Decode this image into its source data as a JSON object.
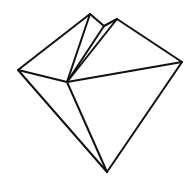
{
  "figure": {
    "canvas": {
      "width": 192,
      "height": 185,
      "background_color": "#ffffff"
    },
    "style": {
      "stroke_color": "#111111",
      "stroke_width": 2,
      "fill": "none",
      "line_cap": "round",
      "line_join": "round"
    },
    "vertices": [
      {
        "id": "left",
        "label": "Left vertex",
        "x": 18,
        "y": 70
      },
      {
        "id": "hub",
        "label": "Central hub vertex",
        "x": 67,
        "y": 82
      },
      {
        "id": "peakA",
        "label": "Left peak",
        "x": 90,
        "y": 14
      },
      {
        "id": "notch",
        "label": "Notch vertex",
        "x": 104,
        "y": 26
      },
      {
        "id": "peakB",
        "label": "Right peak",
        "x": 117,
        "y": 19
      },
      {
        "id": "right",
        "label": "Right vertex",
        "x": 182,
        "y": 62
      },
      {
        "id": "bottom",
        "label": "Bottom apex vertex",
        "x": 107,
        "y": 172
      }
    ],
    "edges": [
      {
        "id": "e1",
        "from": "left",
        "to": "peakA",
        "path": "M 18 70 L 90 14"
      },
      {
        "id": "e2",
        "from": "peakA",
        "to": "hub",
        "path": "M 90 14 L 67 82"
      },
      {
        "id": "e3",
        "from": "peakA",
        "to": "notch",
        "path": "M 90 14 L 104 26"
      },
      {
        "id": "e4",
        "from": "notch",
        "to": "hub",
        "path": "M 104 26 L 67 82"
      },
      {
        "id": "e5",
        "from": "notch",
        "to": "peakB",
        "path": "M 104 26 L 117 19"
      },
      {
        "id": "e6",
        "from": "peakB",
        "to": "hub",
        "path": "M 117 19 L 67 82"
      },
      {
        "id": "e7",
        "from": "peakB",
        "to": "right",
        "path": "M 117 19 L 182 62"
      },
      {
        "id": "e8",
        "from": "left",
        "to": "hub",
        "path": "M 18 70 L 67 82"
      },
      {
        "id": "e9",
        "from": "hub",
        "to": "right",
        "path": "M 67 82 L 182 62"
      },
      {
        "id": "e10",
        "from": "left",
        "to": "bottom",
        "path": "M 18 70 L 107 172"
      },
      {
        "id": "e11",
        "from": "hub",
        "to": "bottom",
        "path": "M 67 82 L 107 172"
      },
      {
        "id": "e12",
        "from": "right",
        "to": "bottom",
        "path": "M 182 62 L 107 172"
      }
    ]
  }
}
